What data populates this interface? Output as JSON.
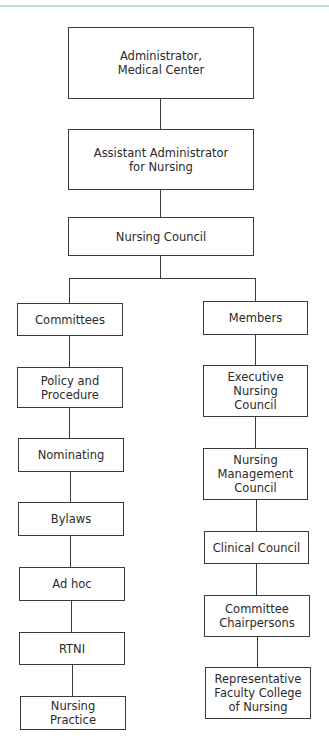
{
  "chart": {
    "top": [
      {
        "id": "administrator",
        "label": "Administrator,\nMedical Center"
      },
      {
        "id": "assistant-administrator",
        "label": "Assistant Administrator\nfor Nursing"
      },
      {
        "id": "nursing-council",
        "label": "Nursing Council"
      }
    ],
    "committees": {
      "header": "Committees",
      "items": [
        "Policy and\nProcedure",
        "Nominating",
        "Bylaws",
        "Ad hoc",
        "RTNI",
        "Nursing\nPractice"
      ]
    },
    "members": {
      "header": "Members",
      "items": [
        "Executive\nNursing\nCouncil",
        "Nursing\nManagement\nCouncil",
        "Clinical Council",
        "Committee\nChairpersons",
        "Representative\nFaculty College\nof Nursing"
      ]
    }
  },
  "colors": {
    "top_rule": "#b9dede",
    "line": "#3a3a3a",
    "text": "#2a2a2a"
  }
}
